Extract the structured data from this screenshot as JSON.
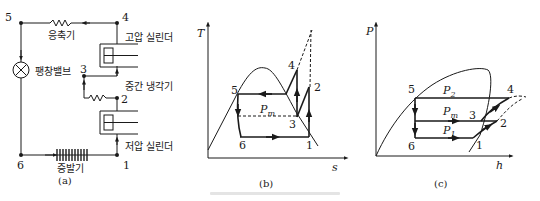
{
  "figure": {
    "panel_a": {
      "caption": "(a)",
      "components": {
        "condenser": "응축기",
        "expansion_valve": "팽창밸브",
        "high_pressure_cylinder": "고압 실린더",
        "intercooler": "중간 냉각기",
        "low_pressure_cylinder": "저압 실린더",
        "evaporator": "증발기"
      },
      "nodes": [
        "1",
        "2",
        "3",
        "4",
        "5",
        "6"
      ]
    },
    "panel_b": {
      "caption": "(b)",
      "y_axis": "T",
      "x_axis": "s",
      "pressure_label": "P",
      "pressure_sub": "m",
      "points": [
        "1",
        "2",
        "3",
        "4",
        "5",
        "6"
      ]
    },
    "panel_c": {
      "caption": "(c)",
      "y_axis": "P",
      "x_axis": "h",
      "p2_label": "P",
      "p2_sub": "2",
      "pm_label": "P",
      "pm_sub": "m",
      "p1_label": "P",
      "p1_sub": "1",
      "points": [
        "1",
        "2",
        "3",
        "4",
        "5",
        "6"
      ]
    },
    "bottom_caption_visible": "illegible faint caption"
  },
  "colors": {
    "ink": "#1a1a1a",
    "background": "#ffffff"
  }
}
